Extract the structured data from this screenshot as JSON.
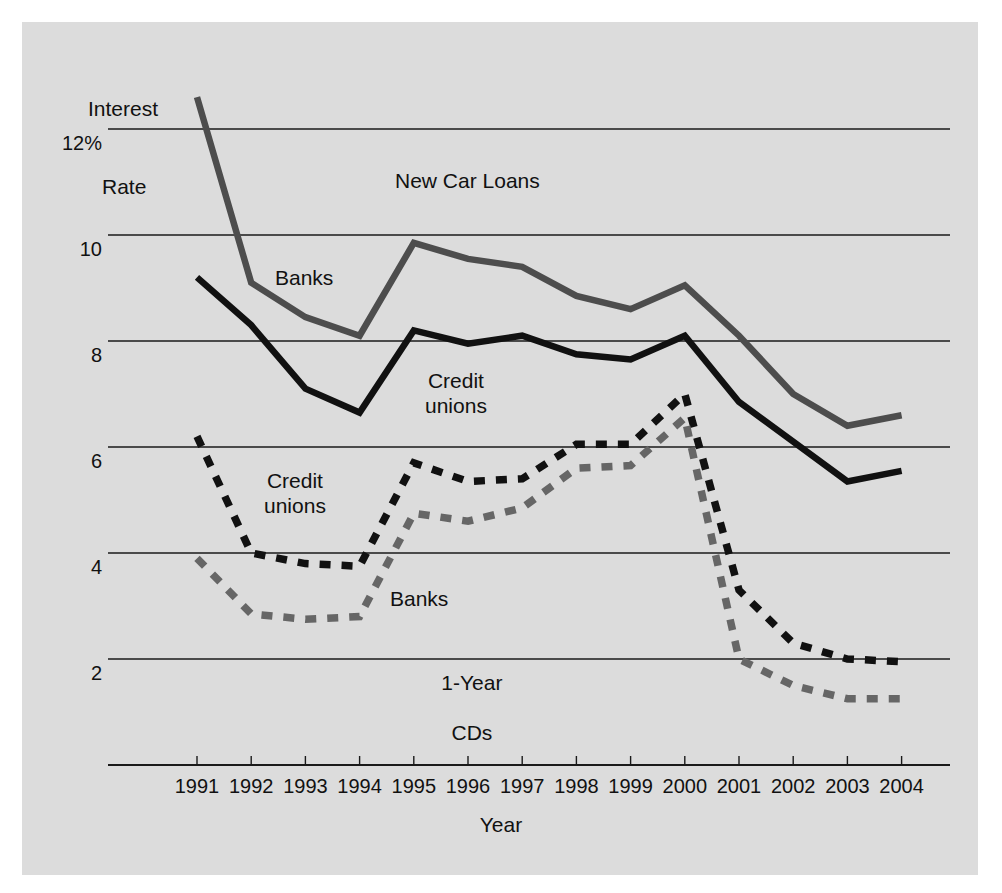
{
  "chart_data": {
    "type": "line",
    "title": "",
    "xlabel": "Year",
    "ylabel": "Interest\nRate",
    "ylabel_line1": "Interest",
    "ylabel_line2": "Rate",
    "x": [
      1991,
      1992,
      1993,
      1994,
      1995,
      1996,
      1997,
      1998,
      1999,
      2000,
      2001,
      2002,
      2003,
      2004
    ],
    "categories": [
      "1991",
      "1992",
      "1993",
      "1994",
      "1995",
      "1996",
      "1997",
      "1998",
      "1999",
      "2000",
      "2001",
      "2002",
      "2003",
      "2004"
    ],
    "ylim": [
      0,
      12
    ],
    "ytick_values": [
      0,
      2,
      4,
      6,
      8,
      10,
      12
    ],
    "ytick_labels": [
      "",
      "2",
      "4",
      "6",
      "8",
      "10",
      "12%"
    ],
    "grid": true,
    "legend_position": "inline-annotations",
    "group_annotations": [
      {
        "text": "New Car Loans",
        "x": 1995.6,
        "y": 11.0
      },
      {
        "text": "1-Year",
        "x": 1996.0,
        "y": 2.2,
        "boxed": true
      },
      {
        "text": "CDs",
        "x": 1996.2,
        "y": 1.55
      }
    ],
    "series": [
      {
        "name": "Banks",
        "group": "New Car Loans",
        "style": "solid",
        "color": "#4d4d4d",
        "label_text": "Banks",
        "label_x": 1992.5,
        "label_y": 9.4,
        "values": [
          12.6,
          9.1,
          8.45,
          8.1,
          9.85,
          9.55,
          9.4,
          8.85,
          8.6,
          9.05,
          8.1,
          7.0,
          6.4,
          6.6
        ]
      },
      {
        "name": "Credit unions",
        "group": "New Car Loans",
        "style": "solid",
        "color": "#111111",
        "label_text": "Credit\nunions",
        "label_x": 1995.0,
        "label_y": 7.5,
        "values": [
          9.2,
          8.3,
          7.1,
          6.65,
          8.2,
          7.95,
          8.1,
          7.75,
          7.65,
          8.1,
          6.85,
          6.1,
          5.35,
          5.55
        ]
      },
      {
        "name": "Credit unions",
        "group": "1-Year CDs",
        "style": "dashed",
        "color": "#111111",
        "label_text": "Credit\nunions",
        "label_x": 1992.4,
        "label_y": 5.55,
        "values": [
          6.2,
          4.0,
          3.8,
          3.75,
          5.7,
          5.35,
          5.4,
          6.05,
          6.05,
          7.0,
          3.3,
          2.3,
          2.0,
          1.95
        ]
      },
      {
        "name": "Banks",
        "group": "1-Year CDs",
        "style": "dashed",
        "color": "#666666",
        "label_text": "Banks",
        "label_x": 1995.4,
        "label_y": 3.35,
        "values": [
          3.9,
          2.85,
          2.75,
          2.8,
          4.75,
          4.6,
          4.85,
          5.6,
          5.65,
          6.55,
          2.0,
          1.5,
          1.25,
          1.25
        ]
      }
    ]
  },
  "axes": {
    "y_title_line1": "Interest",
    "y_title_line2": "Rate",
    "x_title": "Year"
  },
  "colors": {
    "panel_background": "#dcdcdc",
    "page_background": "#ffffff",
    "gridline": "#1a1a1a",
    "series_banks_loans": "#4d4d4d",
    "series_credit_unions_loans": "#111111",
    "series_credit_unions_cds": "#111111",
    "series_banks_cds": "#666666",
    "text": "#111111"
  }
}
